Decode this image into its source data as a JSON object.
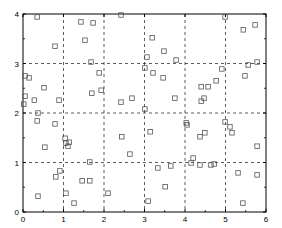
{
  "chart_data": {
    "type": "scatter",
    "title": "",
    "xlabel": "",
    "ylabel": "",
    "xlim": [
      0,
      6
    ],
    "ylim": [
      0,
      4
    ],
    "x_ticks": [
      "0",
      "1",
      "2",
      "3",
      "4",
      "5",
      "6"
    ],
    "y_ticks": [
      "0",
      "1",
      "2",
      "3",
      "4"
    ],
    "grid": true,
    "grid_style": "dashed",
    "marker": "square-open",
    "legend": null,
    "colors": {
      "marker": "#555555",
      "axis": "#000000",
      "grid": "#333333"
    },
    "series": [
      {
        "name": "points",
        "points": [
          [
            0.35,
            3.94
          ],
          [
            0.79,
            3.35
          ],
          [
            1.43,
            3.84
          ],
          [
            1.73,
            3.82
          ],
          [
            1.53,
            3.47
          ],
          [
            2.42,
            3.98
          ],
          [
            3.48,
            3.25
          ],
          [
            3.19,
            3.52
          ],
          [
            4.99,
            3.94
          ],
          [
            5.44,
            3.68
          ],
          [
            5.73,
            3.78
          ],
          [
            0.05,
            2.75
          ],
          [
            0.15,
            2.71
          ],
          [
            0.52,
            2.51
          ],
          [
            0.05,
            2.34
          ],
          [
            0.02,
            2.18
          ],
          [
            0.28,
            2.26
          ],
          [
            0.89,
            2.26
          ],
          [
            1.68,
            3.03
          ],
          [
            1.88,
            2.81
          ],
          [
            1.7,
            2.4
          ],
          [
            1.93,
            2.46
          ],
          [
            2.42,
            2.22
          ],
          [
            2.69,
            2.3
          ],
          [
            3.06,
            3.13
          ],
          [
            3.01,
            2.91
          ],
          [
            3.21,
            2.81
          ],
          [
            3.46,
            2.71
          ],
          [
            3.78,
            3.07
          ],
          [
            3.75,
            2.3
          ],
          [
            4.4,
            2.53
          ],
          [
            4.57,
            2.53
          ],
          [
            4.77,
            2.65
          ],
          [
            4.4,
            2.24
          ],
          [
            4.47,
            2.3
          ],
          [
            5.56,
            2.97
          ],
          [
            4.91,
            2.89
          ],
          [
            5.48,
            2.75
          ],
          [
            5.78,
            3.03
          ],
          [
            0.37,
            2.0
          ],
          [
            0.35,
            1.84
          ],
          [
            0.79,
            1.78
          ],
          [
            0.54,
            1.31
          ],
          [
            1.04,
            1.49
          ],
          [
            1.06,
            1.39
          ],
          [
            1.14,
            1.41
          ],
          [
            1.11,
            1.33
          ],
          [
            2.44,
            1.52
          ],
          [
            2.64,
            1.17
          ],
          [
            3.14,
            1.62
          ],
          [
            3.01,
            2.08
          ],
          [
            4.03,
            1.8
          ],
          [
            4.05,
            1.76
          ],
          [
            4.37,
            1.52
          ],
          [
            4.49,
            1.6
          ],
          [
            4.99,
            1.82
          ],
          [
            5.11,
            1.72
          ],
          [
            5.16,
            1.6
          ],
          [
            5.78,
            1.33
          ],
          [
            1.65,
            1.01
          ],
          [
            0.81,
            0.71
          ],
          [
            0.91,
            0.83
          ],
          [
            1.46,
            0.63
          ],
          [
            1.65,
            0.63
          ],
          [
            0.37,
            0.32
          ],
          [
            1.06,
            0.38
          ],
          [
            1.26,
            0.18
          ],
          [
            2.1,
            0.38
          ],
          [
            3.09,
            0.22
          ],
          [
            3.33,
            0.89
          ],
          [
            3.51,
            0.51
          ],
          [
            3.65,
            0.93
          ],
          [
            4.2,
            1.09
          ],
          [
            4.37,
            0.95
          ],
          [
            4.64,
            0.95
          ],
          [
            4.72,
            0.97
          ],
          [
            4.15,
            0.99
          ],
          [
            5.31,
            0.79
          ],
          [
            5.43,
            0.18
          ],
          [
            5.78,
            0.75
          ]
        ]
      }
    ]
  }
}
